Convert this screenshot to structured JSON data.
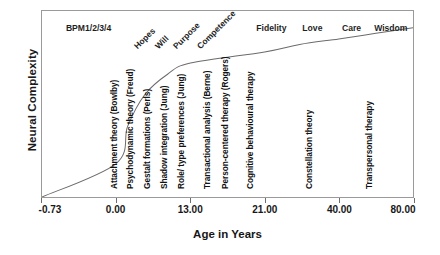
{
  "chart_data": {
    "type": "line",
    "title": "",
    "xlabel": "Age in Years",
    "ylabel": "Neural Complexity",
    "grid": false,
    "legend": "none",
    "x_tick_labels": [
      "-0.73",
      "0.00",
      "13.00",
      "21.00",
      "40.00",
      "80.00"
    ],
    "x_tick_positions_pct": [
      0.0,
      20.0,
      40.0,
      60.0,
      80.0,
      100.0
    ],
    "xlim": [
      -0.73,
      80.0
    ],
    "ylim": [
      0,
      100
    ],
    "series": [
      {
        "name": "Neural Complexity",
        "description": "Logarithmic growth curve rising steeply from the origin then flattening with age",
        "x": [
          -0.73,
          0.0,
          2.0,
          5.0,
          9.0,
          13.0,
          21.0,
          30.0,
          40.0,
          60.0,
          80.0
        ],
        "values": [
          0,
          18,
          38,
          55,
          66,
          72,
          78,
          82,
          85,
          88,
          91
        ]
      }
    ],
    "stage_headers": [
      {
        "label": "BPM1/2/3/4",
        "style": "horizontal",
        "x_pct": 12.5
      },
      {
        "label": "Hopes",
        "style": "diagonal",
        "x_pct": 26.0
      },
      {
        "label": "Will",
        "style": "diagonal",
        "x_pct": 31.5
      },
      {
        "label": "Purpose",
        "style": "diagonal",
        "x_pct": 36.5
      },
      {
        "label": "Competence",
        "style": "diagonal",
        "x_pct": 43.0
      },
      {
        "label": "Fidelity",
        "style": "horizontal",
        "x_pct": 61.5
      },
      {
        "label": "Love",
        "style": "horizontal",
        "x_pct": 72.5
      },
      {
        "label": "Care",
        "style": "horizontal",
        "x_pct": 83.0
      },
      {
        "label": "Wisdom",
        "style": "horizontal",
        "x_pct": 93.5
      }
    ],
    "annotations": [
      {
        "label": "Attachment theory (Bowlby)",
        "x_pct": 20.5
      },
      {
        "label": "Psychodynamic theory (Freud)",
        "x_pct": 25.0
      },
      {
        "label": "Gestalt formations (Perls)",
        "x_pct": 29.5
      },
      {
        "label": "Shadow integration (Jung)",
        "x_pct": 34.0
      },
      {
        "label": "Role/ type preferences (Jung)",
        "x_pct": 38.5
      },
      {
        "label": "Transactional analysis (Berne)",
        "x_pct": 45.5
      },
      {
        "label": "Person-centered therapy (Rogers)",
        "x_pct": 50.5
      },
      {
        "label": "Cognitive behavioural therapy",
        "x_pct": 57.0
      },
      {
        "label": "Constellation theory",
        "x_pct": 73.0
      },
      {
        "label": "Transpersonal therapy",
        "x_pct": 89.0
      }
    ],
    "colors": {
      "curve": "#6b6b6b",
      "frame": "#9a9a9a",
      "text": "#1a1a1a",
      "background": "#ffffff"
    }
  }
}
